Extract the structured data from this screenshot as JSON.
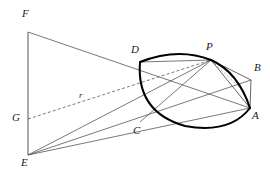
{
  "figure": {
    "kind": "geometric-construction-diagram",
    "background_color": "#ffffff",
    "ink_color": "#3a3a3a",
    "arc_color": "#000000",
    "width": 270,
    "height": 179
  },
  "points": [
    {
      "id": "F",
      "label": "F",
      "x": 28,
      "y": 32,
      "label_x": 22,
      "label_y": 8
    },
    {
      "id": "D",
      "label": "D",
      "x": 140,
      "y": 62,
      "label_x": 131,
      "label_y": 44
    },
    {
      "id": "P",
      "label": "P",
      "x": 211,
      "y": 60,
      "label_x": 206,
      "label_y": 42
    },
    {
      "id": "B",
      "label": "B",
      "x": 251,
      "y": 80,
      "label_x": 254,
      "label_y": 63
    },
    {
      "id": "A",
      "label": "A",
      "x": 250,
      "y": 108,
      "label_x": 252,
      "label_y": 110
    },
    {
      "id": "C",
      "label": "C",
      "x": 140,
      "y": 122,
      "label_x": 133,
      "label_y": 125
    },
    {
      "id": "G",
      "label": "G",
      "x": 28,
      "y": 119,
      "label_x": 13,
      "label_y": 113
    },
    {
      "id": "E",
      "label": "E",
      "x": 28,
      "y": 155,
      "label_x": 21,
      "label_y": 157
    }
  ],
  "segment_labels": [
    {
      "id": "r",
      "label": "r",
      "x": 79,
      "y": 91
    }
  ],
  "arcs": [
    {
      "id": "upper-arc",
      "from": "D",
      "to": "A",
      "via": "P",
      "style": "solid-thick"
    },
    {
      "id": "lower-arc",
      "from": "D",
      "to": "A",
      "via": "C",
      "style": "solid-thick"
    }
  ],
  "segments": [
    {
      "id": "FE",
      "from": "F",
      "to": "E",
      "style": "solid"
    },
    {
      "id": "FA",
      "from": "F",
      "to": "A",
      "style": "solid"
    },
    {
      "id": "EP",
      "from": "E",
      "to": "P",
      "style": "solid"
    },
    {
      "id": "EB",
      "from": "E",
      "to": "B",
      "style": "solid"
    },
    {
      "id": "EA",
      "from": "E",
      "to": "A",
      "style": "solid"
    },
    {
      "id": "GP",
      "from": "G",
      "to": "P",
      "style": "dashed"
    },
    {
      "id": "PA",
      "from": "P",
      "to": "A",
      "style": "solid"
    },
    {
      "id": "PB",
      "from": "P",
      "to": "B",
      "style": "solid"
    },
    {
      "id": "BA",
      "from": "B",
      "to": "A",
      "style": "solid"
    },
    {
      "id": "PG-chord",
      "from": "P",
      "to": "C",
      "style": "solid"
    },
    {
      "id": "PD-chord",
      "from": "P",
      "to": "D",
      "style": "solid"
    }
  ]
}
